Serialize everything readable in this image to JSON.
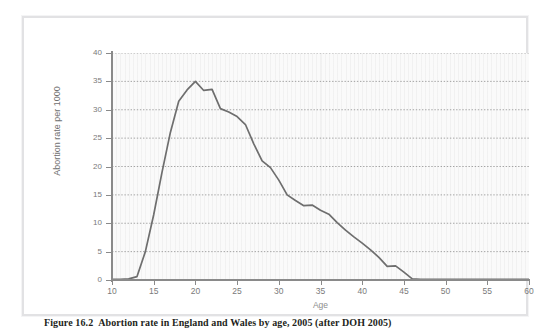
{
  "page": {
    "top_fragment": "                                                                    "
  },
  "figure": {
    "caption_number": "Figure 16.2",
    "caption_text": "Abortion rate in England and Wales by age, 2005 (after DOH 2005)"
  },
  "colors": {
    "line": "#6e6e6e",
    "axis": "#8a8a8a",
    "grid": "#9a9a9a",
    "plot_background": "#fafafa",
    "frame_border": "#e2e2e4",
    "tick_label": "#7a7a7a"
  },
  "chart_data": {
    "type": "line",
    "title": "",
    "subtitle": "",
    "xlabel": "Age",
    "ylabel": "Abortion rate per 1000",
    "xlim": [
      10,
      60
    ],
    "ylim": [
      0,
      40
    ],
    "xticks": [
      10,
      15,
      20,
      25,
      30,
      35,
      40,
      45,
      50,
      55,
      60
    ],
    "xtick_labels": [
      "10",
      "15",
      "20",
      "25",
      "30",
      "35",
      "40",
      "45",
      "50",
      "55",
      "60"
    ],
    "yticks": [
      0,
      5,
      10,
      15,
      20,
      25,
      30,
      35,
      40
    ],
    "ytick_labels": [
      "0",
      "5",
      "10",
      "15",
      "20",
      "25",
      "30",
      "35",
      "40"
    ],
    "grid": {
      "horizontal": true,
      "horizontal_style": "dotted",
      "vertical": true,
      "vertical_style": "faint-solid"
    },
    "legend": {
      "visible": false,
      "position": "none"
    },
    "series": [
      {
        "name": "Abortion rate per 1000",
        "color": "#6e6e6e",
        "x": [
          10,
          11,
          12,
          13,
          14,
          15,
          16,
          17,
          18,
          19,
          20,
          21,
          22,
          23,
          24,
          25,
          26,
          27,
          28,
          29,
          30,
          31,
          32,
          33,
          34,
          35,
          36,
          37,
          38,
          39,
          40,
          41,
          42,
          43,
          44,
          45,
          46,
          47,
          48,
          49,
          50,
          51,
          52,
          53,
          54,
          55,
          56,
          57,
          58,
          59,
          60
        ],
        "values": [
          0.1,
          0.1,
          0.2,
          0.6,
          5.0,
          11.5,
          19.0,
          26.0,
          31.5,
          33.5,
          35.0,
          33.4,
          33.6,
          30.2,
          29.6,
          28.8,
          27.4,
          24.0,
          21.0,
          19.8,
          17.6,
          15.0,
          14.0,
          13.1,
          13.2,
          12.3,
          11.6,
          10.1,
          8.8,
          7.6,
          6.5,
          5.3,
          4.0,
          2.4,
          2.5,
          1.4,
          0.2,
          0.1,
          0.1,
          0.1,
          0.1,
          0.1,
          0.1,
          0.1,
          0.1,
          0.1,
          0.1,
          0.1,
          0.1,
          0.1,
          0.1
        ]
      }
    ],
    "annotations": [
      {
        "text": "peak rate 35 per 1000 at age 20"
      },
      {
        "text": "rate falls to near zero by age 46"
      }
    ]
  }
}
